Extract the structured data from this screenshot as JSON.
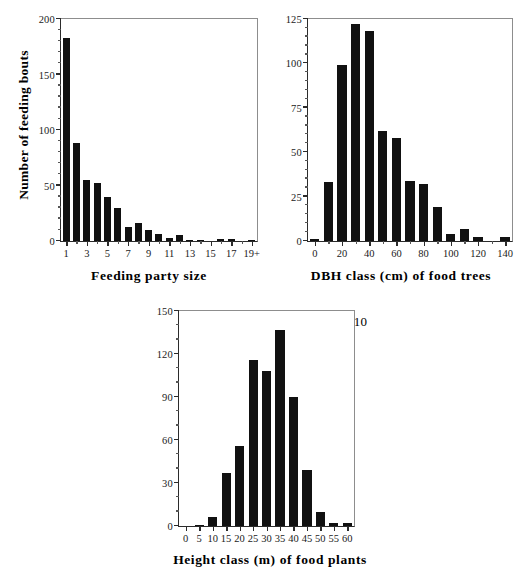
{
  "figure": {
    "background": "#ffffff",
    "bar_color": "#111111",
    "axis_color": "#2b2b2b"
  },
  "chart_data": [
    {
      "id": "feeding-party-size",
      "type": "bar",
      "title": "",
      "xlabel": "Feeding party size",
      "ylabel": "Number of feeding bouts",
      "annotation": "N = 511",
      "grid": false,
      "legend": "none",
      "ylim": [
        0,
        200
      ],
      "yticks": [
        0,
        50,
        100,
        150,
        200
      ],
      "ytick_labels": [
        "0",
        "50",
        "100",
        "150",
        "200"
      ],
      "y_minor_step": 10,
      "categories": [
        "1",
        "2",
        "3",
        "4",
        "5",
        "6",
        "7",
        "8",
        "9",
        "10",
        "11",
        "12",
        "13",
        "14",
        "15",
        "16",
        "17",
        "18",
        "19+"
      ],
      "xtick_labels": [
        "1",
        "3",
        "5",
        "7",
        "9",
        "11",
        "13",
        "15",
        "17",
        "19+"
      ],
      "xtick_categories": [
        "1",
        "3",
        "5",
        "7",
        "9",
        "11",
        "13",
        "15",
        "17",
        "19+"
      ],
      "values": [
        183,
        88,
        55,
        52,
        40,
        30,
        13,
        16,
        10,
        6,
        3,
        5,
        1,
        1,
        0,
        2,
        2,
        0,
        1
      ]
    },
    {
      "id": "dbh-class",
      "type": "bar",
      "title": "",
      "xlabel": "DBH class (cm) of food trees",
      "ylabel": "",
      "annotation": "N = 597",
      "grid": false,
      "legend": "none",
      "ylim": [
        0,
        125
      ],
      "yticks": [
        0,
        25,
        50,
        75,
        100,
        125
      ],
      "ytick_labels": [
        "0",
        "25",
        "50",
        "75",
        "100",
        "125"
      ],
      "y_minor_step": 5,
      "categories": [
        "0",
        "10",
        "20",
        "30",
        "40",
        "50",
        "60",
        "70",
        "80",
        "90",
        "100",
        "110",
        "120",
        "130",
        "140"
      ],
      "xtick_labels": [
        "0",
        "20",
        "40",
        "60",
        "80",
        "100",
        "120",
        "140"
      ],
      "xtick_categories": [
        "0",
        "20",
        "40",
        "60",
        "80",
        "100",
        "120",
        "140"
      ],
      "values": [
        1,
        33,
        99,
        122,
        118,
        62,
        58,
        34,
        32,
        19,
        4,
        7,
        2,
        0,
        2
      ]
    },
    {
      "id": "height-class",
      "type": "bar",
      "title": "",
      "xlabel": "Height class (m) of food plants",
      "ylabel": "",
      "annotation": "N = 610",
      "grid": false,
      "legend": "none",
      "ylim": [
        0,
        150
      ],
      "yticks": [
        0,
        30,
        60,
        90,
        120,
        150
      ],
      "ytick_labels": [
        "0",
        "30",
        "60",
        "90",
        "120",
        "150"
      ],
      "y_minor_step": 10,
      "categories": [
        "0",
        "5",
        "10",
        "15",
        "20",
        "25",
        "30",
        "35",
        "40",
        "45",
        "50",
        "55",
        "60"
      ],
      "xtick_labels": [
        "0",
        "5",
        "10",
        "15",
        "20",
        "25",
        "30",
        "35",
        "40",
        "45",
        "50",
        "55",
        "60"
      ],
      "xtick_categories": [
        "0",
        "5",
        "10",
        "15",
        "20",
        "25",
        "30",
        "35",
        "40",
        "45",
        "50",
        "55",
        "60"
      ],
      "values": [
        0,
        1,
        6,
        37,
        56,
        116,
        108,
        137,
        90,
        39,
        10,
        2,
        2
      ]
    }
  ]
}
